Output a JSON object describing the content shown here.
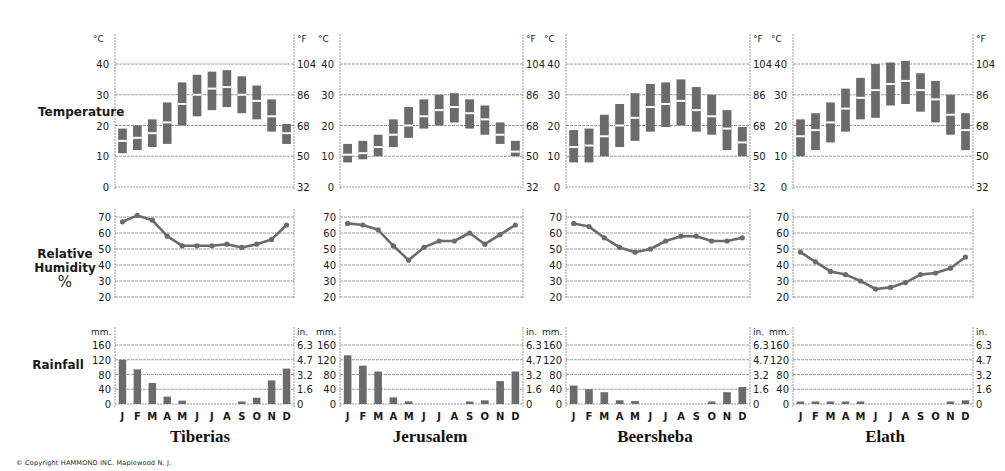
{
  "labels": {
    "temperature": "Temperature",
    "humidity_line1": "Relative",
    "humidity_line2": "Humidity",
    "humidity_line3": "%",
    "rainfall": "Rainfall",
    "copyright": "© Copyright  HAMMOND  INC.   Maplewood  N. J."
  },
  "months": [
    "J",
    "F",
    "M",
    "A",
    "M",
    "J",
    "J",
    "A",
    "S",
    "O",
    "N",
    "D"
  ],
  "axes": {
    "temp_c_unit": "°C",
    "temp_f_unit": "°F",
    "temp_c_ticks": [
      0,
      10,
      20,
      30,
      40
    ],
    "temp_f_ticks": [
      32,
      50,
      68,
      86,
      104
    ],
    "humidity_ticks": [
      20,
      30,
      40,
      50,
      60,
      70
    ],
    "rain_mm_unit": "mm.",
    "rain_in_unit": "in.",
    "rain_mm_ticks": [
      0,
      40,
      80,
      120,
      160
    ],
    "rain_in_ticks": [
      "0",
      "1.6",
      "3.2",
      "4.7",
      "6.3"
    ]
  },
  "colors": {
    "bar": "#6b6b6b",
    "line": "#6b6b6b",
    "grid": "#9a9a9a",
    "text": "#1a1a1a"
  },
  "chart_data": [
    {
      "type": "climograph",
      "title": "Tiberias",
      "categories": [
        "J",
        "F",
        "M",
        "A",
        "M",
        "J",
        "J",
        "A",
        "S",
        "O",
        "N",
        "D"
      ],
      "temperature_c": {
        "min": [
          11,
          12,
          13,
          14,
          20,
          23,
          25,
          26,
          24,
          22,
          18,
          14
        ],
        "mean": [
          15,
          16,
          17.5,
          21,
          27,
          30,
          32,
          32.5,
          30,
          28,
          23,
          17.5
        ],
        "max": [
          19,
          20,
          22,
          27.5,
          34,
          36.5,
          37.5,
          38,
          36,
          33,
          28.5,
          20.5
        ],
        "ylim": [
          0,
          40
        ]
      },
      "relative_humidity_pct": {
        "values": [
          67,
          71,
          68,
          58,
          52,
          52,
          52,
          53,
          51,
          53,
          56,
          65
        ],
        "ylim": [
          20,
          70
        ]
      },
      "rainfall_mm": {
        "values": [
          120,
          94,
          57,
          20,
          9,
          0,
          0,
          0,
          5,
          17,
          64,
          96
        ],
        "ylim": [
          0,
          160
        ]
      }
    },
    {
      "type": "climograph",
      "title": "Jerusalem",
      "categories": [
        "J",
        "F",
        "M",
        "A",
        "M",
        "J",
        "J",
        "A",
        "S",
        "O",
        "N",
        "D"
      ],
      "temperature_c": {
        "min": [
          8,
          9,
          10,
          13,
          16,
          19,
          20,
          21,
          19,
          17,
          14,
          10
        ],
        "mean": [
          10.5,
          11,
          13,
          17,
          20,
          23,
          25,
          26,
          24,
          22,
          17,
          11.5
        ],
        "max": [
          14,
          15,
          17,
          22,
          26,
          28.5,
          30,
          30.5,
          28.5,
          26.5,
          21,
          15
        ],
        "ylim": [
          0,
          40
        ]
      },
      "relative_humidity_pct": {
        "values": [
          66,
          65,
          62,
          52,
          43,
          51,
          55,
          55,
          60,
          53,
          59,
          65
        ],
        "ylim": [
          20,
          70
        ]
      },
      "rainfall_mm": {
        "values": [
          132,
          104,
          88,
          18,
          7,
          0,
          0,
          0,
          4,
          10,
          62,
          88
        ],
        "ylim": [
          0,
          160
        ]
      }
    },
    {
      "type": "climograph",
      "title": "Beersheba",
      "categories": [
        "J",
        "F",
        "M",
        "A",
        "M",
        "J",
        "J",
        "A",
        "S",
        "O",
        "N",
        "D"
      ],
      "temperature_c": {
        "min": [
          8,
          8,
          10,
          13,
          15,
          18,
          19.5,
          20,
          18,
          17,
          12,
          10
        ],
        "mean": [
          13,
          13.5,
          16.5,
          20,
          22.5,
          26,
          27,
          28,
          25,
          23,
          19,
          14.5
        ],
        "max": [
          18.5,
          19,
          23.5,
          27,
          30.5,
          33.5,
          34,
          35,
          32.5,
          30,
          25,
          19.5
        ],
        "ylim": [
          0,
          40
        ]
      },
      "relative_humidity_pct": {
        "values": [
          66,
          64,
          57,
          51,
          48,
          50,
          55,
          58,
          58,
          55,
          55,
          57
        ],
        "ylim": [
          20,
          70
        ]
      },
      "rainfall_mm": {
        "values": [
          50,
          40,
          32,
          10,
          8,
          0,
          0,
          0,
          0,
          6,
          32,
          46
        ],
        "ylim": [
          0,
          160
        ]
      }
    },
    {
      "type": "climograph",
      "title": "Elath",
      "categories": [
        "J",
        "F",
        "M",
        "A",
        "M",
        "J",
        "J",
        "A",
        "S",
        "O",
        "N",
        "D"
      ],
      "temperature_c": {
        "min": [
          10,
          12,
          14.5,
          18,
          22,
          22.5,
          26.5,
          27,
          24.5,
          21,
          17,
          12
        ],
        "mean": [
          16.5,
          18.5,
          21,
          25.5,
          29,
          31.5,
          33.5,
          34.5,
          31.5,
          28.5,
          23.5,
          18.5
        ],
        "max": [
          22,
          24,
          27.5,
          32,
          35.5,
          40,
          40.5,
          41,
          37,
          34.5,
          30,
          24
        ],
        "ylim": [
          0,
          40
        ]
      },
      "relative_humidity_pct": {
        "values": [
          48,
          42,
          36,
          34,
          30,
          25,
          26,
          29,
          34,
          35,
          38,
          45
        ],
        "ylim": [
          20,
          70
        ]
      },
      "rainfall_mm": {
        "values": [
          5,
          6,
          5,
          4,
          2,
          0,
          0,
          0,
          0,
          0,
          5,
          10
        ],
        "ylim": [
          0,
          160
        ]
      }
    }
  ]
}
